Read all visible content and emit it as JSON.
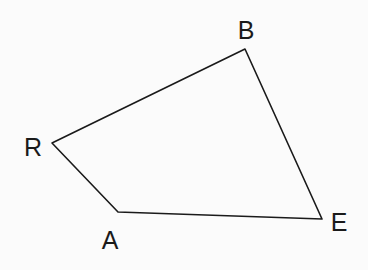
{
  "diagram": {
    "type": "quadrilateral",
    "name": "RBEA",
    "stroke_color": "#1a1a1a",
    "background": "#fbfbfb",
    "vertices": [
      {
        "label": "B",
        "x": 245,
        "y": 49,
        "label_x": 246,
        "label_y": 30
      },
      {
        "label": "E",
        "x": 322,
        "y": 219,
        "label_x": 339,
        "label_y": 222
      },
      {
        "label": "A",
        "x": 118,
        "y": 212,
        "label_x": 110,
        "label_y": 240
      },
      {
        "label": "R",
        "x": 52,
        "y": 143,
        "label_x": 33,
        "label_y": 147
      }
    ],
    "edges": [
      [
        "R",
        "B"
      ],
      [
        "B",
        "E"
      ],
      [
        "E",
        "A"
      ],
      [
        "A",
        "R"
      ]
    ]
  }
}
